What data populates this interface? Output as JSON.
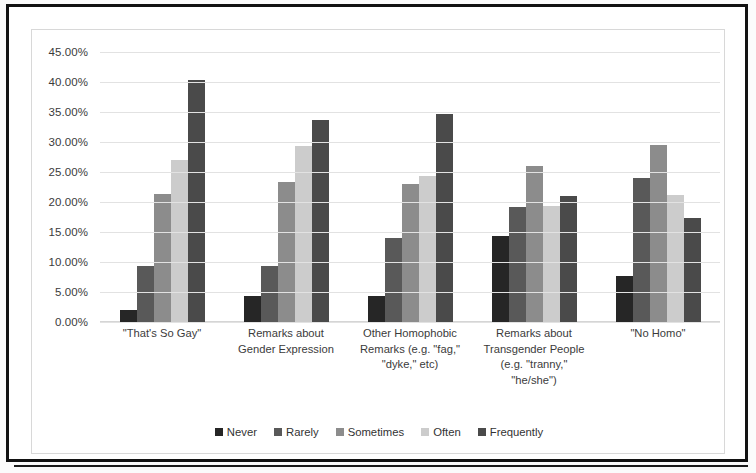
{
  "chart_data": {
    "type": "bar",
    "title": "",
    "subtitle": "",
    "xlabel": "",
    "ylabel": "",
    "ylim": [
      0,
      45
    ],
    "grid": true,
    "legend_position": "bottom",
    "ytick_labels": [
      "45.00%",
      "40.00%",
      "35.00%",
      "30.00%",
      "25.00%",
      "20.00%",
      "15.00%",
      "10.00%",
      "5.00%",
      "0.00%"
    ],
    "ytick_values": [
      45,
      40,
      35,
      30,
      25,
      20,
      15,
      10,
      5,
      0
    ],
    "categories": [
      "\"That's So Gay\"",
      "Remarks about Gender Expression",
      "Other Homophobic Remarks (e.g. \"fag,\" \"dyke,\" etc)",
      "Remarks about Transgender People (e.g. \"tranny,\" \"he/she\")",
      "\"No Homo\""
    ],
    "category_lines": [
      [
        "\"That's So Gay\""
      ],
      [
        "Remarks about",
        "Gender Expression"
      ],
      [
        "Other Homophobic",
        "Remarks (e.g. \"fag,\"",
        "\"dyke,\" etc)"
      ],
      [
        "Remarks about",
        "Transgender People",
        "(e.g. \"tranny,\"",
        "\"he/she\")"
      ],
      [
        "\"No Homo\""
      ]
    ],
    "series": [
      {
        "name": "Never",
        "color": "#262626",
        "values": [
          2.0,
          4.3,
          4.3,
          14.3,
          7.6
        ]
      },
      {
        "name": "Rarely",
        "color": "#595959",
        "values": [
          9.3,
          9.3,
          14.0,
          19.2,
          24.0
        ]
      },
      {
        "name": "Sometimes",
        "color": "#8c8c8c",
        "values": [
          21.3,
          23.4,
          23.0,
          26.0,
          29.5
        ]
      },
      {
        "name": "Often",
        "color": "#cccccc",
        "values": [
          27.0,
          29.3,
          24.3,
          19.4,
          21.2
        ]
      },
      {
        "name": "Frequently",
        "color": "#4a4a4a",
        "values": [
          40.4,
          33.6,
          34.7,
          21.0,
          17.3
        ]
      }
    ]
  },
  "legend": {
    "items": [
      {
        "label": "Never",
        "color": "#262626"
      },
      {
        "label": "Rarely",
        "color": "#595959"
      },
      {
        "label": "Sometimes",
        "color": "#8c8c8c"
      },
      {
        "label": "Often",
        "color": "#cccccc"
      },
      {
        "label": "Frequently",
        "color": "#4a4a4a"
      }
    ]
  }
}
